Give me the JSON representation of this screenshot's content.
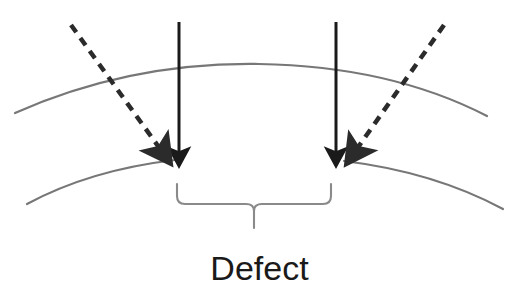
{
  "figure": {
    "background_color": "#ffffff",
    "surface_line_color": "#777777",
    "arrow_color": "#1a1a1a",
    "dashed_arrow_color": "#2b2b2b",
    "brace_color": "#8a8a8a",
    "label": {
      "text": "Defect",
      "color": "#1a1a1a"
    },
    "elements": [
      {
        "name": "upper-surface-curve",
        "type": "curve",
        "style": "solid",
        "color": "#777777"
      },
      {
        "name": "lower-surface-curve-left",
        "type": "curve",
        "style": "solid",
        "color": "#777777"
      },
      {
        "name": "lower-surface-curve-right",
        "type": "curve",
        "style": "solid",
        "color": "#777777"
      },
      {
        "name": "solid-arrow-left",
        "type": "arrow",
        "style": "solid",
        "direction": "down",
        "color": "#1a1a1a"
      },
      {
        "name": "solid-arrow-right",
        "type": "arrow",
        "style": "solid",
        "direction": "down",
        "color": "#1a1a1a"
      },
      {
        "name": "dashed-arrow-left",
        "type": "arrow",
        "style": "dashed",
        "direction": "down-right",
        "color": "#2b2b2b"
      },
      {
        "name": "dashed-arrow-right",
        "type": "arrow",
        "style": "dashed",
        "direction": "down-left",
        "color": "#2b2b2b"
      },
      {
        "name": "defect-brace",
        "type": "brace",
        "orientation": "down",
        "color": "#8a8a8a"
      }
    ]
  },
  "geometry": {
    "upper_curve_path": "M 15 113 Q 130 62 259 64 Q 390 66 487 116",
    "lower_curve_left_path": "M 27 204 Q 95 168 175 160",
    "lower_curve_right_path": "M 344 161 Q 430 172 503 209",
    "solid_arrow_left": {
      "x": 179,
      "y1": 22,
      "y2": 164
    },
    "solid_arrow_right": {
      "x": 336,
      "y1": 22,
      "y2": 164
    },
    "dashed_arrow_left": {
      "x1": 71,
      "y1": 25,
      "x2": 167,
      "y2": 160
    },
    "dashed_arrow_right": {
      "x1": 444,
      "y1": 25,
      "x2": 350,
      "y2": 160
    },
    "brace": {
      "left_x": 177,
      "right_x": 331,
      "top_y": 184,
      "bottom_y": 204,
      "center_x": 254,
      "tip_y": 228
    },
    "label_position": {
      "x": 259,
      "y": 278
    }
  }
}
